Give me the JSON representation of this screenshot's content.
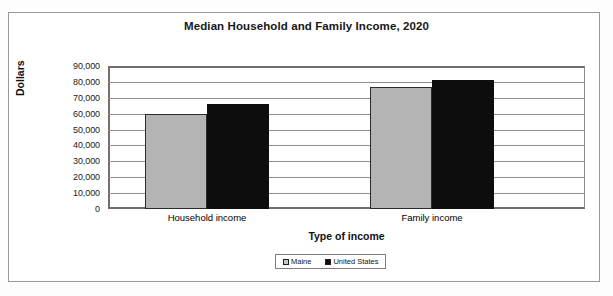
{
  "chart_data": {
    "type": "bar",
    "title": "Median Household and Family Income, 2020",
    "xlabel": "Type of income",
    "ylabel": "Dollars",
    "categories": [
      "Household income",
      "Family income"
    ],
    "series": [
      {
        "name": "Maine",
        "color": "#b4b4b4",
        "values": [
          59500,
          76500
        ]
      },
      {
        "name": "United States",
        "color": "#0d0d0d",
        "values": [
          66000,
          81000
        ]
      }
    ],
    "ylim": [
      0,
      90000
    ],
    "ytick_step": 10000,
    "ytick_labels": [
      "90,000",
      "80,000",
      "70,000",
      "60,000",
      "50,000",
      "40,000",
      "30,000",
      "20,000",
      "10,000",
      "0"
    ],
    "ytick_values": [
      90000,
      80000,
      70000,
      60000,
      50000,
      40000,
      30000,
      20000,
      10000,
      0
    ],
    "grid": true,
    "legend_position": "bottom"
  },
  "legend": {
    "items": [
      {
        "label": "Maine"
      },
      {
        "label": "United States"
      }
    ]
  }
}
